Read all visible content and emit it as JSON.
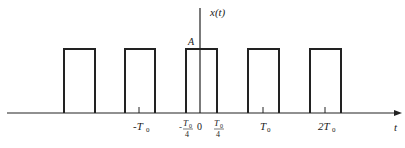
{
  "diagram": {
    "y_axis_label": "x(t)",
    "x_axis_label": "t",
    "amplitude_label": "A",
    "tick_labels": {
      "neg_T0": "-T",
      "neg_T0_sub": "0",
      "neg_T0_over_4_num": "T",
      "neg_T0_over_4_sub": "0",
      "neg_T0_over_4_den": "4",
      "neg_sign": "-",
      "zero": "0",
      "T0_over_4_num": "T",
      "T0_over_4_sub": "0",
      "T0_over_4_den": "4",
      "T0": "T",
      "T0_sub": "0",
      "two_T0": "2T",
      "two_T0_sub": "0"
    },
    "pulses": [
      {
        "x_start": -2.25,
        "x_end": -1.75
      },
      {
        "x_start": -1.25,
        "x_end": -0.75
      },
      {
        "x_start": -0.25,
        "x_end": 0.25
      },
      {
        "x_start": 0.75,
        "x_end": 1.25
      },
      {
        "x_start": 1.75,
        "x_end": 2.25
      }
    ],
    "period": "T0",
    "pulse_width": "T0/2",
    "line_color": "#222222"
  }
}
